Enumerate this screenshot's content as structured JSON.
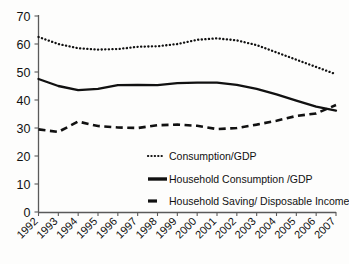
{
  "chart_data": {
    "type": "line",
    "title": "",
    "xlabel": "",
    "ylabel": "",
    "ylim": [
      0,
      70
    ],
    "yticks": [
      0,
      10,
      20,
      30,
      40,
      50,
      60,
      70
    ],
    "ytick_labels": [
      "0",
      "10",
      "20",
      "30",
      "40",
      "50",
      "60",
      "70"
    ],
    "grid": false,
    "legend_position": "inside-lower-right",
    "categories": [
      "1992",
      "1993",
      "1994",
      "1995",
      "1996",
      "1997",
      "1998",
      "1999",
      "2000",
      "2001",
      "2002",
      "2003",
      "2004",
      "2005",
      "2006",
      "2007"
    ],
    "series": [
      {
        "name": "Consumption/GDP",
        "style": "dotted",
        "color": "#111111",
        "values": [
          62.5,
          60.0,
          58.5,
          58.0,
          58.2,
          59.0,
          59.2,
          60.0,
          61.5,
          62.0,
          61.3,
          59.6,
          57.0,
          54.4,
          51.8,
          49.2
        ]
      },
      {
        "name": "Household Consumption /GDP",
        "style": "solid",
        "color": "#111111",
        "values": [
          47.5,
          45.0,
          43.5,
          44.0,
          45.3,
          45.4,
          45.3,
          46.0,
          46.2,
          46.2,
          45.4,
          44.0,
          42.0,
          39.8,
          37.6,
          36.2
        ]
      },
      {
        "name": "Household Saving/ Disposable Income",
        "style": "dashed",
        "color": "#111111",
        "values": [
          29.5,
          28.6,
          32.3,
          30.7,
          30.2,
          30.0,
          31.0,
          31.2,
          30.8,
          29.6,
          30.0,
          31.2,
          32.6,
          34.3,
          35.2,
          38.2
        ]
      }
    ]
  },
  "legend": {
    "items": [
      {
        "label": "Consumption/GDP",
        "style": "dotted"
      },
      {
        "label": "Household Consumption /GDP",
        "style": "solid"
      },
      {
        "label": "Household Saving/ Disposable Income",
        "style": "dashed"
      }
    ]
  }
}
